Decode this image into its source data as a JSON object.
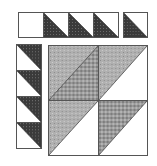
{
  "colors": {
    "dark": "#3a3a3a",
    "medium": "#a8a8a8",
    "medium_check": "#8e8e8e",
    "light": "#ffffff",
    "border": "#555555"
  },
  "top_row": {
    "units": [
      {
        "type": "plain",
        "fill": "light"
      },
      {
        "type": "half-square-triangle",
        "dark_half": "bottom-left"
      },
      {
        "type": "half-square-triangle",
        "dark_half": "bottom-left"
      },
      {
        "type": "half-square-triangle",
        "dark_half": "bottom-left"
      },
      {
        "type": "half-square-triangle",
        "dark_half": "bottom-left",
        "separated": true
      }
    ]
  },
  "left_column": {
    "units": [
      {
        "type": "half-square-triangle",
        "dark_half": "top-right"
      },
      {
        "type": "half-square-triangle",
        "dark_half": "top-right"
      },
      {
        "type": "half-square-triangle",
        "dark_half": "top-right"
      },
      {
        "type": "half-square-triangle",
        "dark_half": "top-right"
      }
    ]
  },
  "center_grid": {
    "units": [
      {
        "position": "top-left",
        "upper": "medium",
        "lower": "medium_check"
      },
      {
        "position": "top-right",
        "upper": "medium",
        "lower": "light"
      },
      {
        "position": "bottom-left",
        "upper": "medium",
        "lower": "light"
      },
      {
        "position": "bottom-right",
        "upper": "medium_check",
        "lower": "light"
      }
    ]
  }
}
